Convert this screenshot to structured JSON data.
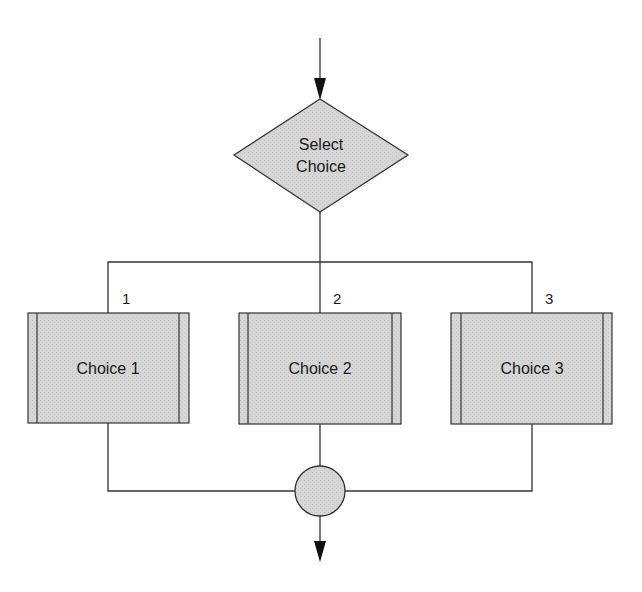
{
  "diagram": {
    "type": "flowchart",
    "colors": {
      "fill": "#d4d4d4",
      "stroke": "#333333",
      "background": "#ffffff"
    },
    "decision": {
      "line1": "Select",
      "line2": "Choice"
    },
    "branches": [
      {
        "number": "1",
        "label": "Choice 1"
      },
      {
        "number": "2",
        "label": "Choice 2"
      },
      {
        "number": "3",
        "label": "Choice 3"
      }
    ],
    "connector": {
      "shape": "circle"
    }
  }
}
